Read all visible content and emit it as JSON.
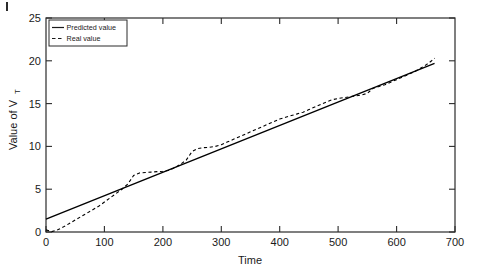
{
  "chart_data": {
    "type": "line",
    "title": "",
    "xlabel": "Time",
    "ylabel": "Value of V_T",
    "ylabel_main": "Value of V",
    "ylabel_sub": "T",
    "xlim": [
      0,
      700
    ],
    "ylim": [
      0,
      25
    ],
    "xticks": [
      0,
      100,
      200,
      300,
      400,
      500,
      600,
      700
    ],
    "yticks": [
      0,
      5,
      10,
      15,
      20,
      25
    ],
    "xtick_labels": [
      "0",
      "100",
      "200",
      "300",
      "400",
      "500",
      "600",
      "700"
    ],
    "ytick_labels": [
      "0",
      "5",
      "10",
      "15",
      "20",
      "25"
    ],
    "grid": false,
    "legend_position": "top-left",
    "series": [
      {
        "name": "Predicted value",
        "style": "solid",
        "color": "#000000",
        "x": [
          0,
          665
        ],
        "values": [
          1.5,
          19.7
        ]
      },
      {
        "name": "Real value",
        "style": "dashed",
        "color": "#000000",
        "x": [
          0,
          10,
          20,
          30,
          40,
          50,
          60,
          70,
          80,
          90,
          100,
          110,
          120,
          130,
          140,
          150,
          160,
          170,
          180,
          190,
          200,
          210,
          220,
          230,
          240,
          250,
          260,
          270,
          280,
          290,
          300,
          310,
          320,
          330,
          340,
          350,
          360,
          370,
          380,
          390,
          400,
          410,
          420,
          430,
          440,
          450,
          460,
          470,
          480,
          490,
          500,
          510,
          520,
          530,
          540,
          550,
          560,
          570,
          580,
          590,
          600,
          610,
          620,
          630,
          640,
          650,
          660,
          665
        ],
        "values": [
          0.25,
          0.05,
          0.25,
          0.6,
          1.0,
          1.4,
          1.8,
          2.2,
          2.6,
          3.0,
          3.5,
          4.0,
          4.5,
          5.0,
          5.6,
          6.6,
          6.9,
          6.95,
          7.0,
          7.05,
          7.1,
          7.2,
          7.5,
          7.9,
          8.4,
          9.4,
          9.75,
          9.85,
          9.9,
          10.0,
          10.2,
          10.5,
          10.8,
          11.1,
          11.4,
          11.7,
          12.0,
          12.3,
          12.6,
          12.9,
          13.2,
          13.4,
          13.6,
          13.8,
          14.0,
          14.3,
          14.6,
          14.9,
          15.2,
          15.45,
          15.6,
          15.7,
          15.8,
          15.9,
          16.0,
          16.2,
          16.8,
          17.0,
          17.2,
          17.5,
          17.8,
          18.1,
          18.4,
          18.7,
          19.1,
          19.5,
          20.0,
          20.3
        ]
      }
    ],
    "legend": [
      "Predicted value",
      "Real value"
    ]
  },
  "axes": {
    "x_axis_name": "Time",
    "y_axis_name": "Value of V"
  }
}
